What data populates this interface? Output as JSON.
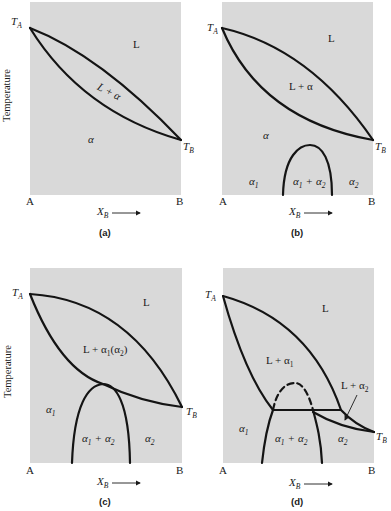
{
  "figure": {
    "y_axis_label": "Temperature",
    "x_axis_label": "X",
    "x_axis_label_sub": "B",
    "x_start_label": "A",
    "x_end_label": "B",
    "ta_label": "T",
    "ta_sub": "A",
    "tb_label": "T",
    "tb_sub": "B"
  },
  "panels": [
    {
      "id": "a",
      "caption": "(a)",
      "regions": {
        "liquid": "L",
        "two_phase": "L + α",
        "solid": "α"
      }
    },
    {
      "id": "b",
      "caption": "(b)",
      "regions": {
        "liquid": "L",
        "two_phase": "L + α",
        "solid": "α",
        "alpha1": "α",
        "alpha1_sub": "1",
        "gap_a": "α",
        "gap_a_sub": "1",
        "gap_plus": "+",
        "gap_b": "α",
        "gap_b_sub": "2",
        "alpha2": "α",
        "alpha2_sub": "2"
      }
    },
    {
      "id": "c",
      "caption": "(c)",
      "regions": {
        "liquid": "L",
        "two_phase_l": "L + α",
        "two_phase_s1": "1",
        "two_phase_paren": "(α",
        "two_phase_s2": "2",
        "two_phase_close": ")",
        "alpha1": "α",
        "alpha1_sub": "1",
        "gap_a": "α",
        "gap_a_sub": "1",
        "gap_plus": "+",
        "gap_b": "α",
        "gap_b_sub": "2",
        "alpha2": "α",
        "alpha2_sub": "2"
      }
    },
    {
      "id": "d",
      "caption": "(d)",
      "regions": {
        "liquid": "L",
        "l_alpha1": "L + α",
        "l_alpha1_sub": "1",
        "l_alpha2": "L + α",
        "l_alpha2_sub": "2",
        "alpha1": "α",
        "alpha1_sub": "1",
        "gap_a": "α",
        "gap_a_sub": "1",
        "gap_plus": "+",
        "gap_b": "α",
        "gap_b_sub": "2",
        "alpha2": "α",
        "alpha2_sub": "2"
      }
    }
  ]
}
